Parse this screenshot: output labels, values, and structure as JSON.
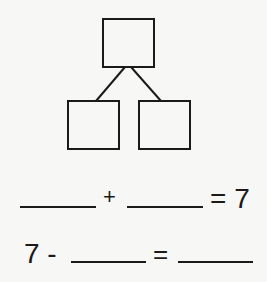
{
  "number_bond": {
    "whole_box": {
      "value": ""
    },
    "part_boxes": [
      {
        "value": ""
      },
      {
        "value": ""
      }
    ]
  },
  "equations": [
    {
      "parts": [
        {
          "type": "blank",
          "value": ""
        },
        {
          "type": "operator",
          "value": "+"
        },
        {
          "type": "blank",
          "value": ""
        },
        {
          "type": "text",
          "value": "= 7"
        }
      ]
    },
    {
      "parts": [
        {
          "type": "text",
          "value": "7 -"
        },
        {
          "type": "blank",
          "value": ""
        },
        {
          "type": "operator",
          "value": "="
        },
        {
          "type": "blank",
          "value": ""
        }
      ]
    }
  ],
  "colors": {
    "ink": "#1a1a1a",
    "background": "#f7f7f5"
  }
}
